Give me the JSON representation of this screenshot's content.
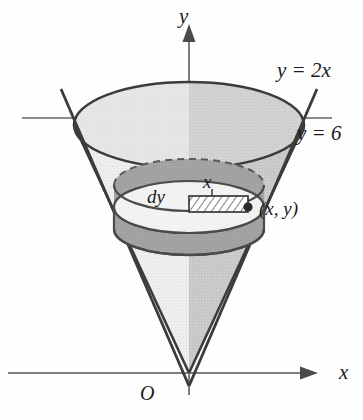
{
  "figure": {
    "axes": {
      "y_axis_label": "y",
      "x_axis_label": "x",
      "origin_label": "O"
    },
    "annotations": {
      "slant_line": "y = 2x",
      "level_line": "y = 6",
      "thickness": "dy",
      "radius": "x",
      "point": "(x, y)"
    },
    "colors": {
      "stroke": "#333333",
      "axis": "#777777",
      "cone_light": "#eeeeee",
      "cone_dark": "#c9c9c9",
      "top_face": "#e4e4e4",
      "ring_band": "#9e9e9e",
      "ring_top": "#f4f4f4",
      "hatch": "#3a3a3a",
      "text": "#1a1a1a"
    },
    "geometry": {
      "apex": [
        189,
        373
      ],
      "y_axis_x": 189,
      "x_axis_y": 373,
      "level_y": 118,
      "top_ellipse_center": [
        189,
        125
      ],
      "top_ellipse_rx": 115,
      "top_ellipse_ry": 43,
      "ring_center": [
        189,
        207
      ],
      "ring_rx": 75,
      "ring_ry": 26,
      "ring_band_height": 22,
      "point_marker": [
        248,
        207
      ]
    }
  }
}
